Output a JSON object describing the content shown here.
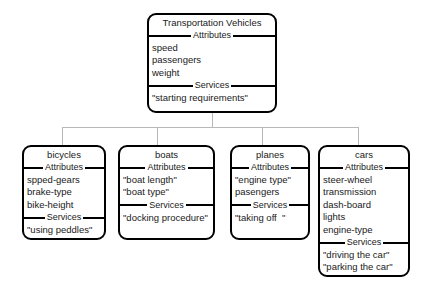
{
  "diagram": {
    "type": "class-hierarchy-tree",
    "section_labels": {
      "attributes": "Attributes",
      "services": "Services"
    },
    "colors": {
      "node_border": "#000000",
      "node_fill": "#ffffff",
      "connector": "#b8b8b8",
      "text": "#1a1a1a",
      "background": "#ffffff"
    },
    "root": {
      "title": "Transportation Vehicles",
      "attributes": [
        "speed",
        "passengers",
        "weight"
      ],
      "services": [
        "\"starting requirements\""
      ]
    },
    "children": [
      {
        "title": "bicycles",
        "attributes": [
          "spped-gears",
          "brake-type",
          "bike-height"
        ],
        "services": [
          "\"using peddles\""
        ]
      },
      {
        "title": "boats",
        "attributes": [
          "\"boat length\"",
          "\"boat type\""
        ],
        "services": [
          "\"docking procedure\""
        ]
      },
      {
        "title": "planes",
        "attributes": [
          "\"engine type\"",
          "pasengers"
        ],
        "services": [
          "\"taking off  \""
        ]
      },
      {
        "title": "cars",
        "attributes": [
          "steer-wheel",
          "transmission",
          "dash-board",
          "lights",
          "engine-type"
        ],
        "services": [
          "\"driving the car\"",
          "\"parking the car\"",
          "\"stopping the car\""
        ]
      }
    ]
  }
}
